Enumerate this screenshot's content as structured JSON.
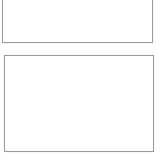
{
  "canvas": {
    "width_px": 164,
    "height_px": 166,
    "background_color": "#ffffff"
  },
  "panels": [
    {
      "id": "top-panel",
      "border_color": "#9a9a9a",
      "fill_color": "#ffffff",
      "content": "",
      "clipped_at_top": true
    },
    {
      "id": "bottom-panel",
      "border_color": "#9a9a9a",
      "fill_color": "#ffffff",
      "content": "",
      "clipped_at_top": false
    }
  ]
}
